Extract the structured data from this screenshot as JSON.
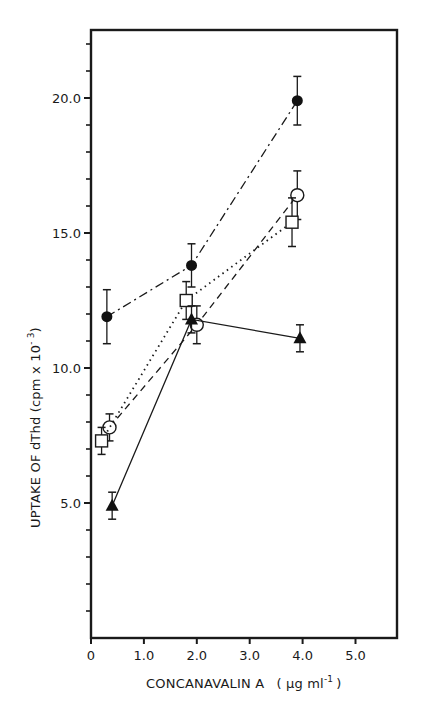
{
  "chart_data": {
    "type": "line",
    "title": "",
    "xlabel": "CONCANAVALIN A",
    "xlabel_unit": "( µg ml",
    "xlabel_unit_sup": "-1",
    "xlabel_unit_close": ")",
    "ylabel": "UPTAKE OF dThd  (cpm x 10",
    "ylabel_sup": "- 3",
    "ylabel_close": ")",
    "xlim": [
      0,
      5.8
    ],
    "ylim": [
      0,
      22.5
    ],
    "x_ticks": [
      {
        "value": 0,
        "label": "0"
      },
      {
        "value": 1.0,
        "label": "1.0"
      },
      {
        "value": 2.0,
        "label": "2.0"
      },
      {
        "value": 3.0,
        "label": "3.0"
      },
      {
        "value": 4.0,
        "label": "4.0"
      },
      {
        "value": 5.0,
        "label": "5.0"
      }
    ],
    "y_ticks": [
      {
        "value": 5.0,
        "label": "5.0"
      },
      {
        "value": 10.0,
        "label": "10.0"
      },
      {
        "value": 15.0,
        "label": "15.0"
      },
      {
        "value": 20.0,
        "label": "20.0"
      }
    ],
    "y_minor_tick_step": 1.0,
    "grid": false,
    "legend": null,
    "series": [
      {
        "name": "filled-circle",
        "marker": "filled-circle",
        "line_style": "dash-dot",
        "points": [
          {
            "x": 0.3,
            "y": 11.9,
            "err": 1.0
          },
          {
            "x": 1.9,
            "y": 13.8,
            "err": 0.8
          },
          {
            "x": 3.9,
            "y": 19.9,
            "err": 0.9
          }
        ]
      },
      {
        "name": "open-circle",
        "marker": "open-circle",
        "line_style": "dashed",
        "points": [
          {
            "x": 0.35,
            "y": 7.8,
            "err": 0.5
          },
          {
            "x": 2.0,
            "y": 11.6,
            "err": 0.7
          },
          {
            "x": 3.9,
            "y": 16.4,
            "err": 0.9
          }
        ]
      },
      {
        "name": "open-square",
        "marker": "open-square",
        "line_style": "dotted",
        "points": [
          {
            "x": 0.2,
            "y": 7.3,
            "err": 0.5
          },
          {
            "x": 1.8,
            "y": 12.5,
            "err": 0.7
          },
          {
            "x": 3.8,
            "y": 15.4,
            "err": 0.9
          }
        ]
      },
      {
        "name": "filled-triangle",
        "marker": "filled-triangle",
        "line_style": "solid",
        "points": [
          {
            "x": 0.4,
            "y": 4.9,
            "err": 0.5
          },
          {
            "x": 1.9,
            "y": 11.8,
            "err": 0.5
          },
          {
            "x": 3.95,
            "y": 11.1,
            "err": 0.5
          }
        ]
      }
    ]
  }
}
